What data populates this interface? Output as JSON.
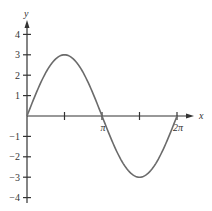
{
  "chart_data": {
    "type": "line",
    "title": "",
    "xlabel": "x",
    "ylabel": "y",
    "function": "y = 3 sin x",
    "xlim": [
      0,
      6.2832
    ],
    "ylim": [
      -4,
      4
    ],
    "x_ticks": [
      {
        "value": 1.5708,
        "label": ""
      },
      {
        "value": 3.1416,
        "label": "π"
      },
      {
        "value": 4.7124,
        "label": ""
      },
      {
        "value": 6.2832,
        "label": "2π"
      }
    ],
    "y_ticks": [
      {
        "value": 4,
        "label": "4"
      },
      {
        "value": 3,
        "label": "3"
      },
      {
        "value": 2,
        "label": "2"
      },
      {
        "value": 1,
        "label": "1"
      },
      {
        "value": -1,
        "label": "−1"
      },
      {
        "value": -2,
        "label": "−2"
      },
      {
        "value": -3,
        "label": "−3"
      },
      {
        "value": -4,
        "label": "−4"
      }
    ],
    "series": [
      {
        "name": "3 sin x",
        "x": [
          0,
          0.7854,
          1.5708,
          2.3562,
          3.1416,
          3.927,
          4.7124,
          5.4978,
          6.2832
        ],
        "values": [
          0,
          2.12,
          3,
          2.12,
          0,
          -2.12,
          -3,
          -2.12,
          0
        ]
      }
    ],
    "grid": false,
    "legend": "none",
    "colors": {
      "curve": "#6b6b6b",
      "axis": "#333333"
    }
  }
}
